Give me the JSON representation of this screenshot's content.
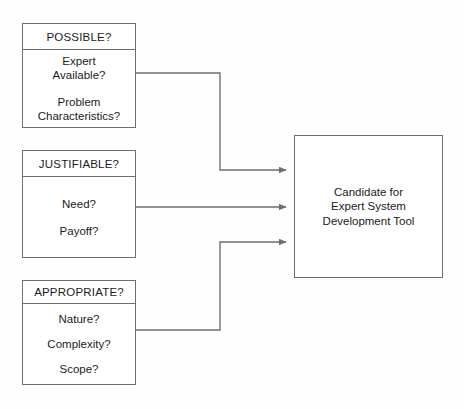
{
  "diagram": {
    "line_color": "#6e6e6e",
    "text_color": "#1b1b1b",
    "background": "#fefefe",
    "criteria": [
      {
        "header": "POSSIBLE?",
        "items": [
          "Expert\nAvailable?",
          "Problem\nCharacteristics?"
        ]
      },
      {
        "header": "JUSTIFIABLE?",
        "items": [
          "Need?",
          "Payoff?"
        ]
      },
      {
        "header": "APPROPRIATE?",
        "items": [
          "Nature?",
          "Complexity?",
          "Scope?"
        ]
      }
    ],
    "target": {
      "label": "Candidate for\nExpert System\nDevelopment Tool"
    }
  }
}
